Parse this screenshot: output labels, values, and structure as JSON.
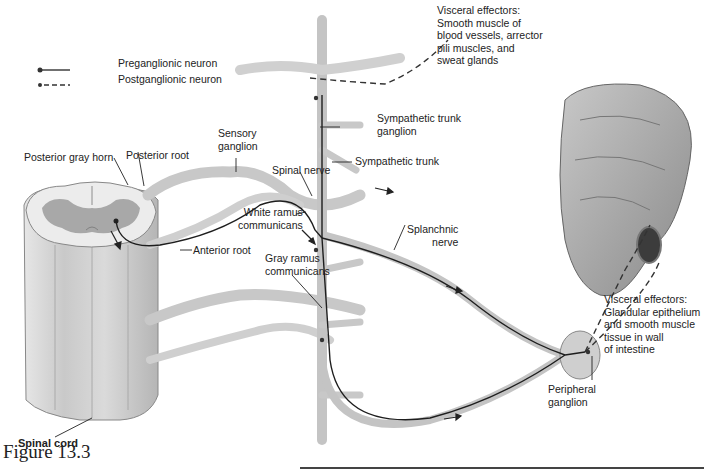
{
  "figure": {
    "caption": "Figure 13.3"
  },
  "legend": {
    "items": [
      {
        "label": "Preganglionic neuron",
        "line_style": "solid"
      },
      {
        "label": "Postganglionic neuron",
        "line_style": "dashed"
      }
    ]
  },
  "labels": {
    "visceral_effectors_top": "Visceral effectors:\nSmooth muscle of\nblood vessels, arrector\npili muscles, and\nsweat glands",
    "sympathetic_trunk_ganglion": "Sympathetic trunk\nganglion",
    "sympathetic_trunk": "Sympathetic trunk",
    "sensory_ganglion": "Sensory\nganglion",
    "posterior_gray_horn": "Posterior gray horn",
    "posterior_root": "Posterior root",
    "spinal_nerve": "Spinal nerve",
    "white_ramus": "White ramus\ncommunicans",
    "anterior_root": "Anterior root",
    "gray_ramus": "Gray ramus\ncommunicans",
    "splanchnic_nerve": "Splanchnic\nnerve",
    "visceral_effectors_bottom": "Visceral effectors:\nGlandular epithelium\nand smooth muscle\ntissue in wall\nof intestine",
    "peripheral_ganglion": "Peripheral\nganglion",
    "spinal_cord": "Spinal cord"
  },
  "colors": {
    "nerve_fill": "#dcdcdc",
    "nerve_stroke": "#9a9a9a",
    "gray_matter": "#a8a8a8",
    "cord_fill": "#cfcfcf",
    "neuron_line": "#1e1e1e",
    "intestine": "#a0a0a0",
    "intestine_dark": "#555555"
  }
}
